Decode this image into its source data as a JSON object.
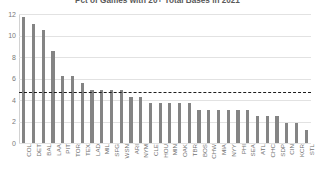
{
  "chart_data": {
    "type": "bar",
    "title": "Pct of Games with 20+ Total Bases in 2021",
    "xlabel": "",
    "ylabel": "",
    "ylim": [
      0,
      12
    ],
    "yticks": [
      0,
      2,
      4,
      6,
      8,
      10,
      12
    ],
    "grid": true,
    "legend": "none",
    "bar_color": "#848484",
    "categories": [
      "COL",
      "DET",
      "BAL",
      "LAA",
      "PIT",
      "TOR",
      "TEX",
      "LAD",
      "MIL",
      "SFG",
      "WSN",
      "ARI",
      "NYM",
      "CLE",
      "HOU",
      "MIN",
      "OAK",
      "TBR",
      "BOS",
      "CHW",
      "MIA",
      "NYY",
      "PHI",
      "SEA",
      "ATL",
      "CHC",
      "SDP",
      "CIN",
      "KCR",
      "STL"
    ],
    "values": [
      11.7,
      11.1,
      10.5,
      8.6,
      6.2,
      6.2,
      5.6,
      4.9,
      4.9,
      4.9,
      4.9,
      4.3,
      4.3,
      3.7,
      3.7,
      3.7,
      3.7,
      3.7,
      3.1,
      3.1,
      3.1,
      3.1,
      3.1,
      3.1,
      2.5,
      2.5,
      2.5,
      1.9,
      1.9,
      1.2
    ],
    "annotations": [
      {
        "type": "hline",
        "name": "league-average",
        "value": 4.7,
        "style": "dashed",
        "color": "#1d1d1d"
      }
    ]
  }
}
